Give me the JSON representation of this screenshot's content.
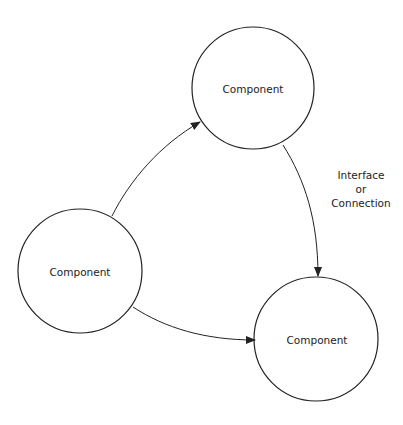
{
  "diagram": {
    "type": "component-interaction",
    "colors": {
      "stroke": "#222222",
      "background": "#ffffff",
      "text": "#222222"
    },
    "nodes": [
      {
        "id": "top",
        "label": "Component",
        "cx": 253,
        "cy": 88,
        "r": 61
      },
      {
        "id": "left",
        "label": "Component",
        "cx": 80,
        "cy": 271,
        "r": 62
      },
      {
        "id": "bottom-right",
        "label": "Component",
        "cx": 316,
        "cy": 339,
        "r": 62
      }
    ],
    "edges": [
      {
        "from": "left",
        "to": "top",
        "directed": true
      },
      {
        "from": "left",
        "to": "bottom-right",
        "directed": true
      },
      {
        "from": "top",
        "to": "bottom-right",
        "directed": true,
        "label": [
          "Interface",
          "or",
          "Connection"
        ]
      }
    ],
    "edge_label": {
      "line1": "Interface",
      "line2": "or",
      "line3": "Connection"
    }
  }
}
